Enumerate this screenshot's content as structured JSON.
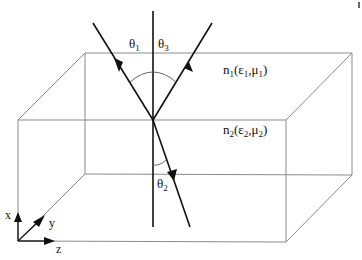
{
  "diagram": {
    "colors": {
      "box_edge": "#8a8a8a",
      "ray": "#111111",
      "text": "#111111",
      "background": "#ffffff"
    },
    "labels": {
      "theta1": {
        "base": "θ",
        "sub": "1"
      },
      "theta3": {
        "base": "θ",
        "sub": "3"
      },
      "theta2": {
        "base": "θ",
        "sub": "2"
      },
      "medium1": {
        "n": "n",
        "n_sub": "1",
        "open": "(",
        "eps": "ε",
        "eps_sub": "1",
        "comma": ",",
        "mu": "μ",
        "mu_sub": "1",
        "close": ")"
      },
      "medium2": {
        "n": "n",
        "n_sub": "2",
        "open": "(",
        "eps": "ε",
        "eps_sub": "2",
        "comma": ",",
        "mu": "μ",
        "mu_sub": "2",
        "close": ")"
      }
    },
    "axes": {
      "x_label": "x",
      "y_label": "y",
      "z_label": "z"
    },
    "rays": [
      {
        "name": "incident",
        "from": [
          93,
          23
        ],
        "to": [
          153,
          120
        ]
      },
      {
        "name": "reflected",
        "from": [
          153,
          120
        ],
        "to": [
          212,
          23
        ]
      },
      {
        "name": "refracted",
        "from": [
          153,
          120
        ],
        "to": [
          190,
          227
        ]
      }
    ],
    "normal": {
      "x": 153,
      "y_top": 11,
      "y_bottom": 227
    }
  }
}
